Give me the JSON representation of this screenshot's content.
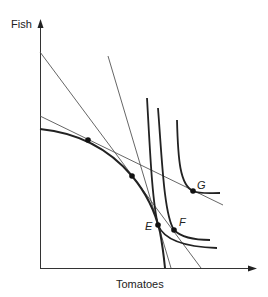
{
  "diagram": {
    "type": "economics-ppf-indifference",
    "y_axis_label": "Fish",
    "x_axis_label": "Tomatoes",
    "points": [
      {
        "label": "",
        "x": 88,
        "y": 140
      },
      {
        "label": "",
        "x": 132,
        "y": 176
      },
      {
        "label": "E",
        "x": 158,
        "y": 225
      },
      {
        "label": "F",
        "x": 174,
        "y": 230
      },
      {
        "label": "G",
        "x": 193,
        "y": 191
      }
    ],
    "labels": {
      "E": "E",
      "F": "F",
      "G": "G"
    },
    "curves": {
      "ppf": "production possibility frontier",
      "indifference_curves": 3,
      "price_lines": 3
    },
    "colors": {
      "line": "#222222",
      "thin_line": "#555555",
      "background": "#ffffff"
    }
  }
}
